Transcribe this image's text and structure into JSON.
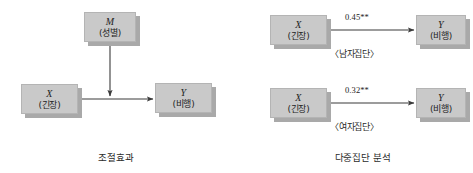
{
  "figure": {
    "panels": [
      {
        "id": "moderation",
        "caption": "조절효과",
        "nodes": [
          {
            "id": "m",
            "var": "M",
            "ko": "(성별)"
          },
          {
            "id": "x",
            "var": "X",
            "ko": "(긴장)"
          },
          {
            "id": "y",
            "var": "Y",
            "ko": "(비행)"
          }
        ]
      },
      {
        "id": "multigroup",
        "caption": "다중집단 분석",
        "rows": [
          {
            "id": "male",
            "group_label": "〈남자집단〉",
            "coefficient": "0.45**",
            "nodes": [
              {
                "id": "x",
                "var": "X",
                "ko": "(긴장)"
              },
              {
                "id": "y",
                "var": "Y",
                "ko": "(비행)"
              }
            ]
          },
          {
            "id": "female",
            "group_label": "〈여자집단〉",
            "coefficient": "0.32**",
            "nodes": [
              {
                "id": "x",
                "var": "X",
                "ko": "(긴장)"
              },
              {
                "id": "y",
                "var": "Y",
                "ko": "(비행)"
              }
            ]
          }
        ]
      }
    ],
    "colors": {
      "node_fill": "#c9c9c9",
      "node_border": "#b4b4b4",
      "node_shadow": "#a9a9a9",
      "arrow": "#3a3a3a",
      "text": "#232323",
      "background": "#ffffff"
    }
  }
}
